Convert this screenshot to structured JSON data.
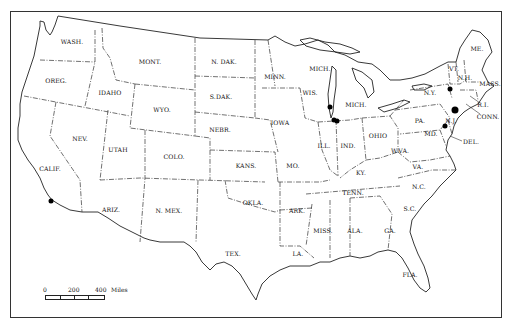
{
  "map": {
    "title": "",
    "states": [
      {
        "abbr": "WASH.",
        "x": 72,
        "y": 41
      },
      {
        "abbr": "OREG.",
        "x": 56,
        "y": 80
      },
      {
        "abbr": "CALIF.",
        "x": 50,
        "y": 168
      },
      {
        "abbr": "IDAHO",
        "x": 110,
        "y": 92
      },
      {
        "abbr": "NEV.",
        "x": 80,
        "y": 138
      },
      {
        "abbr": "MONT.",
        "x": 150,
        "y": 61
      },
      {
        "abbr": "WYO.",
        "x": 162,
        "y": 109
      },
      {
        "abbr": "UTAH",
        "x": 118,
        "y": 149
      },
      {
        "abbr": "COLO.",
        "x": 174,
        "y": 156
      },
      {
        "abbr": "ARIZ.",
        "x": 111,
        "y": 209
      },
      {
        "abbr": "N. MEX.",
        "x": 169,
        "y": 210
      },
      {
        "abbr": "N. DAK.",
        "x": 224,
        "y": 61
      },
      {
        "abbr": "S.DAK.",
        "x": 221,
        "y": 96
      },
      {
        "abbr": "NEBR.",
        "x": 220,
        "y": 129
      },
      {
        "abbr": "KANS.",
        "x": 246,
        "y": 165
      },
      {
        "abbr": "OKLA.",
        "x": 253,
        "y": 202
      },
      {
        "abbr": "TEX.",
        "x": 233,
        "y": 253
      },
      {
        "abbr": "MINN.",
        "x": 275,
        "y": 76
      },
      {
        "abbr": "IOWA",
        "x": 280,
        "y": 122
      },
      {
        "abbr": "MO.",
        "x": 293,
        "y": 165
      },
      {
        "abbr": "ARK.",
        "x": 297,
        "y": 210
      },
      {
        "abbr": "LA.",
        "x": 298,
        "y": 253
      },
      {
        "abbr": "WIS.",
        "x": 310,
        "y": 92
      },
      {
        "abbr": "MICH.",
        "x": 320,
        "y": 68
      },
      {
        "abbr": "MICH.",
        "x": 356,
        "y": 104
      },
      {
        "abbr": "ILL.",
        "x": 324,
        "y": 145
      },
      {
        "abbr": "IND.",
        "x": 348,
        "y": 145
      },
      {
        "abbr": "OHIO",
        "x": 378,
        "y": 135
      },
      {
        "abbr": "KY.",
        "x": 361,
        "y": 172
      },
      {
        "abbr": "TENN.",
        "x": 353,
        "y": 192
      },
      {
        "abbr": "MISS.",
        "x": 323,
        "y": 230
      },
      {
        "abbr": "ALA.",
        "x": 355,
        "y": 230
      },
      {
        "abbr": "GA.",
        "x": 390,
        "y": 230
      },
      {
        "abbr": "FLA.",
        "x": 410,
        "y": 274
      },
      {
        "abbr": "S.C.",
        "x": 410,
        "y": 208
      },
      {
        "abbr": "N.C.",
        "x": 419,
        "y": 186
      },
      {
        "abbr": "VA.",
        "x": 418,
        "y": 166
      },
      {
        "abbr": "W.VA.",
        "x": 400,
        "y": 150
      },
      {
        "abbr": "PA.",
        "x": 420,
        "y": 120
      },
      {
        "abbr": "N.Y.",
        "x": 430,
        "y": 92
      },
      {
        "abbr": "VT.",
        "x": 454,
        "y": 68
      },
      {
        "abbr": "N.H.",
        "x": 465,
        "y": 77
      },
      {
        "abbr": "ME.",
        "x": 477,
        "y": 48
      },
      {
        "abbr": "MASS.",
        "x": 490,
        "y": 83
      },
      {
        "abbr": "R.I.",
        "x": 483,
        "y": 104
      },
      {
        "abbr": "CONN.",
        "x": 488,
        "y": 116
      },
      {
        "abbr": "N.J.",
        "x": 451,
        "y": 120
      },
      {
        "abbr": "DEL.",
        "x": 471,
        "y": 141
      },
      {
        "abbr": "MD.",
        "x": 431,
        "y": 133
      }
    ],
    "markers": [
      {
        "name": "southern-california",
        "x": 51,
        "y": 201,
        "size": "normal"
      },
      {
        "name": "wisconsin-lakeshore",
        "x": 330,
        "y": 107,
        "size": "normal"
      },
      {
        "name": "chicago-area-1",
        "x": 334,
        "y": 120,
        "size": "normal"
      },
      {
        "name": "chicago-area-2",
        "x": 337,
        "y": 121,
        "size": "normal"
      },
      {
        "name": "central-new-york",
        "x": 450,
        "y": 89,
        "size": "normal"
      },
      {
        "name": "new-york-city",
        "x": 455,
        "y": 110,
        "size": "big"
      },
      {
        "name": "philadelphia-area",
        "x": 445,
        "y": 126,
        "size": "normal"
      }
    ],
    "scale_bar": {
      "ticks": [
        "0",
        "200",
        "400"
      ],
      "unit": "Miles"
    }
  }
}
